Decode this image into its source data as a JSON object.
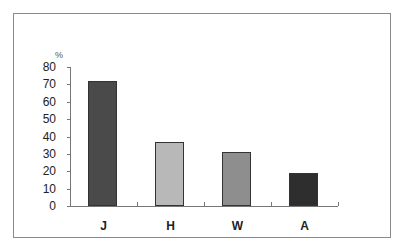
{
  "chart_data": {
    "type": "bar",
    "title": "",
    "xlabel": "",
    "ylabel": "%",
    "categories": [
      "J",
      "H",
      "W",
      "A"
    ],
    "values": [
      72,
      37,
      31,
      19
    ],
    "colors": [
      "#4a4a4a",
      "#b8b8b8",
      "#8e8e8e",
      "#2e2e2e"
    ],
    "ylim": [
      0,
      80
    ],
    "yticks": [
      0,
      10,
      20,
      30,
      40,
      50,
      60,
      70,
      80
    ],
    "grid": false,
    "legend": null
  }
}
